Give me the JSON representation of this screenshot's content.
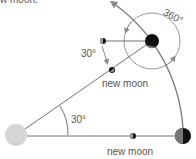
{
  "caption_fragment": "w moon.",
  "labels": {
    "new_moon_upper": "new moon",
    "new_moon_lower": "new moon",
    "angle_sun": "30°",
    "angle_moon": "30°",
    "full_rotation": "360°"
  },
  "colors": {
    "sun": "#d6d6d6",
    "line": "#707070",
    "arrow": "#8a8a8a",
    "earth_dark": "#111111",
    "earth_light": "#777777",
    "text": "#555555"
  },
  "bodies": {
    "sun": {
      "cx": 16,
      "cy": 135,
      "r": 11
    },
    "earth_bottom": {
      "cx": 183,
      "cy": 136,
      "r": 8
    },
    "earth_top": {
      "cx": 152,
      "cy": 41,
      "r": 7
    },
    "moon_top": {
      "cx": 103,
      "cy": 41,
      "r": 3
    },
    "moon_diag": {
      "cx": 112,
      "cy": 70,
      "r": 3
    },
    "moon_bottom": {
      "cx": 133,
      "cy": 136,
      "r": 3
    }
  }
}
